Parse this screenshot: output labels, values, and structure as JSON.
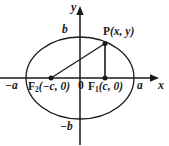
{
  "figure": {
    "type": "ellipse-with-foci-diagram",
    "stroke_color": "#1a1a1a",
    "background_color": "#ffffff"
  },
  "labels": {
    "y_axis": "y",
    "x_axis": "x",
    "b_top": "b",
    "b_bottom": "−b",
    "a_left": "−a",
    "a_right": "a",
    "origin": "0",
    "point_p": "P(x, y)",
    "point_p_name": "P",
    "point_p_coords": "(x, y)",
    "focus_left_name": "F",
    "focus_left_sub": "2",
    "focus_left_coords": "(−c, 0)",
    "focus_right_name": "F",
    "focus_right_sub": "1",
    "focus_right_coords": "(c, 0)"
  },
  "geometry": {
    "center": {
      "x": 80,
      "y": 78
    },
    "semi_major_a": 54,
    "semi_minor_b": 41,
    "focus_left": {
      "x": 51,
      "y": 78
    },
    "focus_right": {
      "x": 105,
      "y": 78
    },
    "point_p": {
      "x": 105,
      "y": 43
    },
    "x_axis_start": {
      "x": 0,
      "y": 78
    },
    "x_axis_arrow_tip": {
      "x": 159,
      "y": 78
    },
    "y_axis_arrow_tip": {
      "x": 80,
      "y": 7
    },
    "y_axis_bottom": {
      "x": 80,
      "y": 144
    }
  }
}
